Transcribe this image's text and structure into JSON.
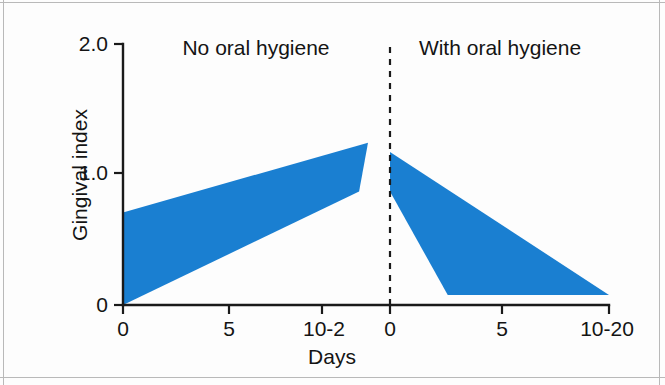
{
  "chart_data": {
    "type": "area",
    "title": "",
    "xlabel": "Days",
    "ylabel": "Gingival index",
    "ylim": [
      0,
      2.0
    ],
    "grid": false,
    "legend": null,
    "band_color": "#1a7fd1",
    "axis_color": "#141414",
    "panels": [
      {
        "name": "No oral hygiene",
        "label": "No oral hygiene",
        "x_ticks": [
          "0",
          "5",
          "10-2"
        ],
        "x_tick_values": [
          0,
          5,
          11
        ],
        "upper": [
          {
            "x": 0,
            "y": 0.7
          },
          {
            "x": 11,
            "y": 1.23
          }
        ],
        "lower": [
          {
            "x": 0,
            "y": 0.0
          },
          {
            "x": 10.6,
            "y": 0.86
          }
        ]
      },
      {
        "name": "With oral hygiene",
        "label": "With oral hygiene",
        "x_ticks": [
          "0",
          "5",
          "10-20"
        ],
        "x_tick_values": [
          0,
          5,
          11
        ],
        "upper": [
          {
            "x": 0,
            "y": 1.16
          },
          {
            "x": 11,
            "y": 0.076
          }
        ],
        "lower": [
          {
            "x": 0,
            "y": 0.86
          },
          {
            "x": 2.9,
            "y": 0.076
          },
          {
            "x": 11,
            "y": 0.076
          }
        ]
      }
    ],
    "y_ticks": [
      "0",
      "1.0",
      "2.0"
    ],
    "y_tick_values": [
      0,
      1.0,
      2.0
    ],
    "divider": {
      "label": "hygiene-start-divider",
      "style": "dashed",
      "x_value": 0
    }
  },
  "axes": {
    "y_title": "Gingival index",
    "x_title": "Days",
    "y_ticks": [
      {
        "label": "2.0",
        "value": 2.0
      },
      {
        "label": "1.0",
        "value": 1.0
      },
      {
        "label": "0",
        "value": 0
      }
    ],
    "x_ticks": [
      {
        "label": "0",
        "px": 123
      },
      {
        "label": "5",
        "px": 229
      },
      {
        "label": "10-2",
        "px": 322
      },
      {
        "label": "0",
        "px": 390
      },
      {
        "label": "5",
        "px": 502
      },
      {
        "label": "10-20",
        "px": 607
      }
    ]
  },
  "panel_titles": {
    "left": "No oral hygiene",
    "right": "With oral hygiene"
  }
}
